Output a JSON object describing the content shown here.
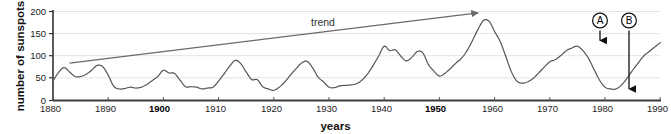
{
  "chart_data": {
    "type": "line",
    "title": "",
    "xlabel": "years",
    "ylabel": "number of sunspots",
    "xlim": [
      1880,
      1990
    ],
    "ylim": [
      0,
      200
    ],
    "grid": true,
    "legend": "none",
    "xticks": [
      1880,
      1890,
      1900,
      1910,
      1920,
      1930,
      1940,
      1950,
      1960,
      1970,
      1980,
      1990
    ],
    "xticks_bold": [
      1900,
      1950
    ],
    "yticks": [
      0,
      50,
      100,
      150,
      200
    ],
    "series": [
      {
        "name": "sunspot number",
        "x": [
          1880,
          1881,
          1882,
          1883,
          1884,
          1885,
          1886,
          1887,
          1888,
          1889,
          1890,
          1891,
          1892,
          1893,
          1894,
          1895,
          1896,
          1897,
          1898,
          1899,
          1900,
          1901,
          1902,
          1903,
          1904,
          1905,
          1906,
          1907,
          1908,
          1909,
          1910,
          1911,
          1912,
          1913,
          1914,
          1915,
          1916,
          1917,
          1918,
          1919,
          1920,
          1921,
          1922,
          1923,
          1924,
          1925,
          1926,
          1927,
          1928,
          1929,
          1930,
          1931,
          1932,
          1933,
          1934,
          1935,
          1936,
          1937,
          1938,
          1939,
          1940,
          1941,
          1942,
          1943,
          1944,
          1945,
          1946,
          1947,
          1948,
          1949,
          1950,
          1951,
          1952,
          1953,
          1954,
          1955,
          1956,
          1957,
          1958,
          1959,
          1960,
          1961,
          1962,
          1963,
          1964,
          1965,
          1966,
          1967,
          1968,
          1969,
          1970,
          1971,
          1972,
          1973,
          1974,
          1975,
          1976,
          1977,
          1978,
          1979,
          1980,
          1981,
          1982,
          1983,
          1984,
          1985,
          1986,
          1987,
          1988,
          1989,
          1990
        ],
        "values": [
          44,
          63,
          74,
          64,
          54,
          54,
          59,
          68,
          79,
          76,
          57,
          32,
          26,
          27,
          30,
          28,
          30,
          36,
          45,
          54,
          68,
          62,
          61,
          46,
          31,
          31,
          30,
          26,
          28,
          30,
          44,
          60,
          77,
          90,
          83,
          64,
          47,
          47,
          31,
          26,
          23,
          30,
          42,
          57,
          71,
          84,
          88,
          74,
          53,
          42,
          30,
          29,
          33,
          34,
          35,
          38,
          46,
          60,
          79,
          100,
          122,
          112,
          114,
          100,
          89,
          97,
          110,
          107,
          81,
          66,
          55,
          61,
          72,
          84,
          95,
          112,
          135,
          160,
          180,
          178,
          155,
          133,
          100,
          66,
          44,
          39,
          42,
          50,
          62,
          75,
          87,
          92,
          101,
          112,
          118,
          122,
          112,
          95,
          70,
          46,
          30,
          26,
          26,
          35,
          50,
          68,
          84,
          100,
          110,
          120,
          130
        ],
        "units": "sunspot number"
      }
    ],
    "annotations": [
      {
        "name": "trend",
        "label": "trend",
        "type": "arrow-line",
        "from": {
          "x": 1883,
          "y": 84
        },
        "to": {
          "x": 1957,
          "y": 197
        }
      },
      {
        "name": "marker-a",
        "label": "A",
        "type": "circled-arrow",
        "points_to": {
          "x": 1980,
          "y": 155
        },
        "meaning": "solar maximum"
      },
      {
        "name": "marker-b",
        "label": "B",
        "type": "circled-arrow",
        "points_to": {
          "x": 1986,
          "y": 13
        },
        "meaning": "solar minimum"
      }
    ],
    "colors": {
      "line": "#555555",
      "axis": "#333333",
      "grid": "#e2e2e2",
      "annotation": "#111111",
      "trend": "#6b6b6b",
      "background": "#ffffff"
    }
  },
  "axes": {
    "y_title": "number of sunspots",
    "x_title": "years",
    "y_tick_labels": [
      "200",
      "150",
      "100",
      "50",
      "0"
    ],
    "x_tick_labels": [
      "1880",
      "1890",
      "1900",
      "1910",
      "1920",
      "1930",
      "1940",
      "1950",
      "1960",
      "1970",
      "1980",
      "1990"
    ]
  },
  "annotations_text": {
    "trend_label": "trend",
    "marker_a": "A",
    "marker_b": "B"
  }
}
